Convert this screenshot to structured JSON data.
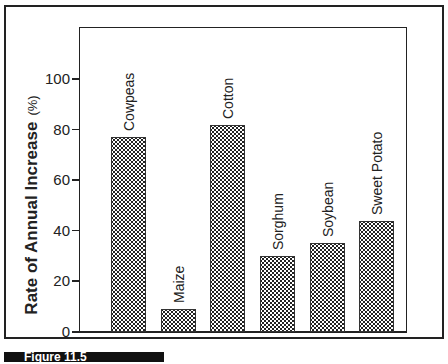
{
  "chart_data": {
    "type": "bar",
    "title": "",
    "xlabel": "",
    "ylabel": "Rate of Annual Increase",
    "ylabel_unit": "(%)",
    "ylim": [
      0,
      120
    ],
    "yticks": [
      "0",
      "20",
      "40",
      "60",
      "80",
      "100"
    ],
    "categories": [
      "Cowpeas",
      "Maize",
      "Cotton",
      "Sorghum",
      "Soybean",
      "Sweet Potato"
    ],
    "values": [
      77,
      9,
      82,
      30,
      35,
      44
    ],
    "grid": false,
    "legend": null
  },
  "figure_label": "Figure 11.5"
}
